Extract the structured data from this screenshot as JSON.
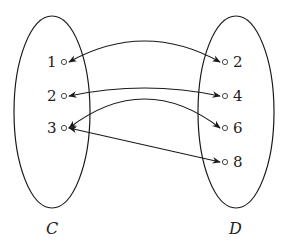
{
  "diagram": {
    "type": "mapping-diagram",
    "sets": [
      {
        "id": "C",
        "label": "C",
        "elements": [
          "1",
          "2",
          "3"
        ]
      },
      {
        "id": "D",
        "label": "D",
        "elements": [
          "2",
          "4",
          "6",
          "8"
        ]
      }
    ],
    "relations": [
      {
        "from": "1",
        "to": "2",
        "direction": "both"
      },
      {
        "from": "2",
        "to": "4",
        "direction": "both"
      },
      {
        "from": "3",
        "to": "6",
        "direction": "both"
      },
      {
        "from": "3",
        "to": "8",
        "direction": "both"
      }
    ],
    "colors": {
      "stroke": "#1a1a1a",
      "text": "#222222"
    }
  }
}
